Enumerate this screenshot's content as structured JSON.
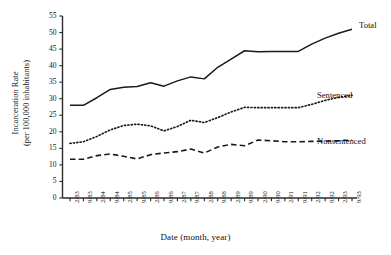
{
  "chart_data": {
    "type": "line",
    "title": "",
    "xlabel": "Date (month, year)",
    "ylabel": "Incarceration Rate (per 100,000 inhabitants)",
    "ylabel_line1": "Incarceration Rate",
    "ylabel_line2": "(per 100,000 inhabitants)",
    "ylim": [
      0,
      55
    ],
    "ytick_values": [
      0,
      5,
      10,
      15,
      20,
      25,
      30,
      35,
      40,
      45,
      50,
      55
    ],
    "ytick_labels": [
      "0",
      "5",
      "10",
      "15",
      "20",
      "25",
      "30",
      "35",
      "40",
      "45",
      "50",
      "55"
    ],
    "grid": false,
    "legend_position": "right-inline-labels",
    "categories": [
      "2/83",
      "9/83",
      "2/84",
      "9/84",
      "2/85",
      "9/85",
      "2/86",
      "9/86",
      "2/87",
      "9/87",
      "2/88",
      "9/88",
      "2/89",
      "9/89",
      "2/90",
      "9/90",
      "2/91",
      "9/91",
      "2/92",
      "9/92",
      "2/93",
      "9/93"
    ],
    "series": [
      {
        "name": "Total",
        "style": "solid",
        "color": "#1a1a1a",
        "values": [
          28.0,
          28.0,
          30.3,
          32.8,
          33.5,
          33.7,
          34.8,
          33.8,
          35.4,
          36.6,
          36.0,
          39.5,
          42.0,
          44.5,
          44.2,
          44.3,
          44.3,
          44.3,
          46.5,
          48.3,
          49.8,
          51.0
        ]
      },
      {
        "name": "Sentenced",
        "style": "dotted",
        "color": "#1a1a1a",
        "values": [
          16.5,
          17.0,
          18.6,
          20.6,
          21.9,
          22.3,
          21.8,
          20.3,
          21.6,
          23.5,
          22.8,
          24.3,
          26.0,
          27.4,
          27.3,
          27.3,
          27.3,
          27.3,
          28.3,
          29.5,
          30.4,
          31.0
        ]
      },
      {
        "name": "Nonsentenced",
        "style": "dashed",
        "color": "#1a1a1a",
        "values": [
          11.7,
          11.7,
          12.8,
          13.3,
          12.6,
          11.8,
          13.1,
          13.6,
          14.0,
          14.8,
          13.6,
          15.4,
          16.2,
          15.8,
          17.5,
          17.3,
          17.0,
          17.0,
          17.1,
          17.2,
          17.3,
          17.5
        ]
      }
    ],
    "annotations": [
      {
        "text": "Total",
        "series": "Total"
      },
      {
        "text": "Sentenced",
        "series": "Sentenced"
      },
      {
        "text": "Nonsentenced",
        "series": "Nonsentenced"
      }
    ]
  }
}
